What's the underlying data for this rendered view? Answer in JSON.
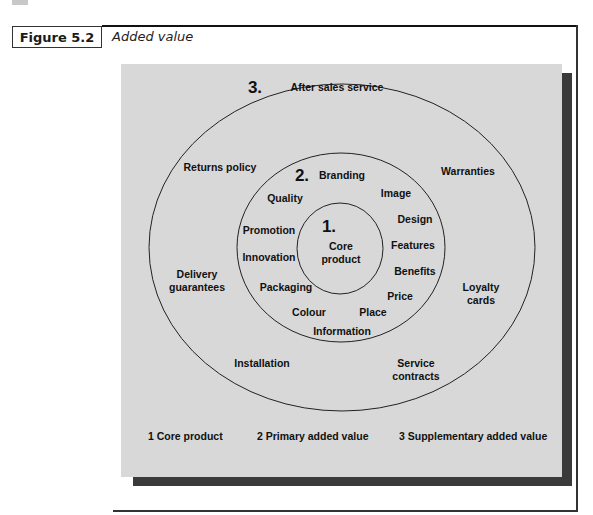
{
  "figure": {
    "label": "Figure 5.2",
    "title": "Added value"
  },
  "diagram": {
    "rings": [
      {
        "number": "1.",
        "name": "Core product",
        "label_lines": [
          "Core",
          "product"
        ],
        "items": []
      },
      {
        "number": "2.",
        "name": "Primary added value",
        "items": [
          "Branding",
          "Image",
          "Quality",
          "Design",
          "Promotion",
          "Features",
          "Innovation",
          "Benefits",
          "Packaging",
          "Price",
          "Colour",
          "Place",
          "Information"
        ]
      },
      {
        "number": "3.",
        "name": "Supplementary added value",
        "items": [
          "After sales service",
          "Returns policy",
          "Warranties",
          "Delivery guarantees",
          "Loyalty cards",
          "Installation",
          "Service contracts"
        ]
      }
    ],
    "outer": {
      "after_sales": "After sales service",
      "returns": "Returns policy",
      "warranties": "Warranties",
      "delivery_1": "Delivery",
      "delivery_2": "guarantees",
      "loyalty_1": "Loyalty",
      "loyalty_2": "cards",
      "installation": "Installation",
      "service_1": "Service",
      "service_2": "contracts"
    },
    "middle": {
      "branding": "Branding",
      "image": "Image",
      "quality": "Quality",
      "design": "Design",
      "promotion": "Promotion",
      "features": "Features",
      "innovation": "Innovation",
      "benefits": "Benefits",
      "packaging": "Packaging",
      "price": "Price",
      "colour": "Colour",
      "place": "Place",
      "information": "Information"
    },
    "core": {
      "line1": "Core",
      "line2": "product"
    },
    "numbers": {
      "one": "1.",
      "two": "2.",
      "three": "3."
    },
    "legend": {
      "item1": "1 Core product",
      "item2": "2 Primary added value",
      "item3": "3 Supplementary added value"
    },
    "colors": {
      "panel": "#d8d8d8",
      "shadow": "#3a3a3a",
      "ring_stroke": "#222222"
    }
  }
}
